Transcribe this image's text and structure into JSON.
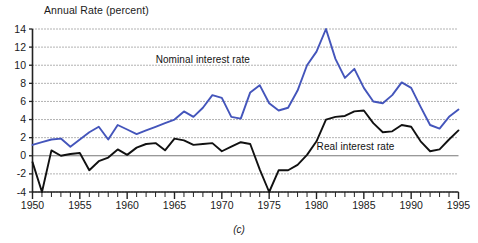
{
  "figure": {
    "panel_caption": "(c)",
    "y_axis_title": "Annual Rate (percent)"
  },
  "chart_data": {
    "type": "line",
    "title": "Annual Rate (percent)",
    "xlabel": "",
    "ylabel": "Annual Rate (percent)",
    "xlim": [
      1950,
      1995
    ],
    "ylim": [
      -4,
      14
    ],
    "ytick_values": [
      14,
      12,
      10,
      8,
      6,
      4,
      2,
      0,
      -2,
      -4
    ],
    "ytick_labels": [
      "14",
      "12",
      "10",
      "8",
      "6",
      "4",
      "2",
      "0",
      "-2",
      "-4"
    ],
    "xtick_values": [
      1950,
      1955,
      1960,
      1965,
      1970,
      1975,
      1980,
      1985,
      1990,
      1995
    ],
    "xtick_labels": [
      "1950",
      "1955",
      "1960",
      "1965",
      "1970",
      "1975",
      "1980",
      "1985",
      "1990",
      "1995"
    ],
    "minor_xticks_every": 1,
    "grid": "horizontal-dotted",
    "zero_line": true,
    "legend": "inline-annotations",
    "x": [
      1950,
      1951,
      1952,
      1953,
      1954,
      1955,
      1956,
      1957,
      1958,
      1959,
      1960,
      1961,
      1962,
      1963,
      1964,
      1965,
      1966,
      1967,
      1968,
      1969,
      1970,
      1971,
      1972,
      1973,
      1974,
      1975,
      1976,
      1977,
      1978,
      1979,
      1980,
      1981,
      1982,
      1983,
      1984,
      1985,
      1986,
      1987,
      1988,
      1989,
      1990,
      1991,
      1992,
      1993,
      1994,
      1995
    ],
    "series": [
      {
        "name": "Nominal interest rate",
        "color": "#4455bb",
        "label_x": 1968.5,
        "label_y": 10.6,
        "values": [
          1.2,
          1.5,
          1.8,
          1.9,
          1.0,
          1.8,
          2.6,
          3.2,
          1.8,
          3.4,
          2.9,
          2.4,
          2.8,
          3.2,
          3.6,
          4.0,
          4.9,
          4.3,
          5.3,
          6.7,
          6.4,
          4.3,
          4.1,
          7.0,
          7.8,
          5.8,
          5.0,
          5.3,
          7.2,
          10.0,
          11.5,
          14.0,
          10.7,
          8.6,
          9.6,
          7.5,
          6.0,
          5.8,
          6.7,
          8.1,
          7.5,
          5.4,
          3.4,
          3.0,
          4.3,
          5.1
        ]
      },
      {
        "name": "Real interest rate",
        "color": "#111111",
        "label_x": 1985.5,
        "label_y": 1.0,
        "values": [
          -0.7,
          -4.0,
          0.6,
          0.0,
          0.2,
          0.3,
          -1.6,
          -0.6,
          -0.2,
          0.7,
          0.1,
          0.9,
          1.3,
          1.4,
          0.6,
          1.9,
          1.7,
          1.2,
          1.3,
          1.4,
          0.5,
          1.0,
          1.5,
          1.3,
          -1.5,
          -4.0,
          -1.6,
          -1.6,
          -1.0,
          0.1,
          1.6,
          4.0,
          4.3,
          4.4,
          4.9,
          5.0,
          3.6,
          2.6,
          2.7,
          3.4,
          3.2,
          1.6,
          0.5,
          0.7,
          1.8,
          2.8
        ]
      }
    ]
  }
}
